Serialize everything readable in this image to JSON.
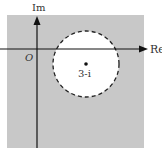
{
  "diagram": {
    "axes": {
      "x_label": "Re",
      "y_label": "Im",
      "origin_label": "O"
    },
    "region": {
      "description": "Shaded plane excluding open disk",
      "shade_color": "#c8c8c8"
    },
    "circle": {
      "center_label": "3-i",
      "border_style": "dashed",
      "fill_color": "#ffffff"
    }
  }
}
